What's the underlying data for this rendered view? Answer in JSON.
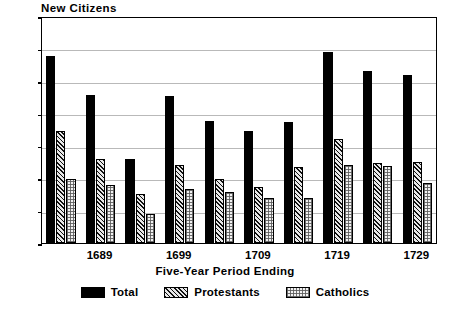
{
  "chart_data": {
    "type": "bar",
    "title": "New Citizens",
    "xlabel": "Five-Year Period Ending",
    "ylabel": "",
    "ylim": [
      0,
      350
    ],
    "yticks": [
      0,
      50,
      100,
      150,
      200,
      250,
      300,
      350
    ],
    "grid": true,
    "legend_position": "bottom",
    "categories": [
      "1684",
      "1689",
      "1694",
      "1699",
      "1704",
      "1709",
      "1714",
      "1719",
      "1724",
      "1729"
    ],
    "visible_tick_labels": [
      "1689",
      "1699",
      "1709",
      "1719",
      "1729"
    ],
    "visible_tick_categories": [
      1,
      3,
      5,
      7,
      9
    ],
    "series": [
      {
        "name": "Total",
        "values": [
          288,
          228,
          129,
          226,
          188,
          172,
          186,
          294,
          265,
          259
        ]
      },
      {
        "name": "Protestants",
        "values": [
          172,
          130,
          75,
          120,
          98,
          87,
          117,
          160,
          124,
          125
        ]
      },
      {
        "name": "Catholics",
        "values": [
          98,
          90,
          45,
          83,
          79,
          69,
          70,
          120,
          119,
          93
        ]
      }
    ],
    "colors": {
      "total": "#000000",
      "protestants": "#e8e8e8",
      "catholics": "#f2f2f2",
      "gridline": "#b9b9b9",
      "axis": "#000000",
      "background": "#ffffff"
    }
  },
  "legend": {
    "items": [
      {
        "label": "Total",
        "swatch": "solid-black-swatch"
      },
      {
        "label": "Protestants",
        "swatch": "diagonal-hatch-swatch"
      },
      {
        "label": "Catholics",
        "swatch": "dotted-grid-swatch"
      }
    ]
  }
}
